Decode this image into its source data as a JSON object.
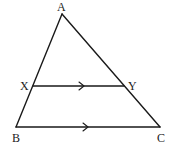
{
  "diagram": {
    "type": "geometry-triangle",
    "colors": {
      "line": "#1a1a1a",
      "label": "#222222",
      "background": "#ffffff"
    },
    "points": {
      "A": {
        "label": "A",
        "x": 62,
        "y": 14
      },
      "B": {
        "label": "B",
        "x": 16,
        "y": 127
      },
      "C": {
        "label": "C",
        "x": 160,
        "y": 127
      },
      "X": {
        "label": "X",
        "x": 33,
        "y": 86
      },
      "Y": {
        "label": "Y",
        "x": 124,
        "y": 86
      }
    },
    "segments": [
      "AB",
      "AC",
      "BC",
      "XY"
    ],
    "parallel_marks": [
      {
        "segment": "XY",
        "mark": "single-arrow",
        "x": 83,
        "y": 86
      },
      {
        "segment": "BC",
        "mark": "single-arrow",
        "x": 87,
        "y": 127
      }
    ],
    "relations": [
      "XY ∥ BC",
      "X on AB",
      "Y on AC"
    ]
  }
}
